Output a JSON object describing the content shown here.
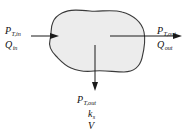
{
  "figure": {
    "background_color": "#ffffff"
  },
  "blob": {
    "name": "control-volume",
    "fill_color": "#ececec",
    "stroke_color": "#3a3a3a"
  },
  "arrows": {
    "inlet": {
      "direction": "right",
      "name": "inlet-arrow"
    },
    "outlet": {
      "direction": "right",
      "name": "outlet-arrow"
    },
    "loss": {
      "direction": "down",
      "name": "loss-arrow"
    }
  },
  "labels": {
    "inlet": {
      "power": {
        "symbol": "P",
        "subscript": "T,in"
      },
      "flow": {
        "symbol": "Q",
        "subscript": "in"
      }
    },
    "outlet": {
      "power": {
        "symbol": "P",
        "subscript": "T,out"
      },
      "flow": {
        "symbol": "Q",
        "subscript": "out"
      }
    },
    "loss": {
      "power": {
        "symbol": "P",
        "subscript": "T,out"
      },
      "stiffness": {
        "symbol": "k",
        "subscript": "s"
      },
      "volume": {
        "symbol": "V",
        "subscript": ""
      }
    }
  }
}
